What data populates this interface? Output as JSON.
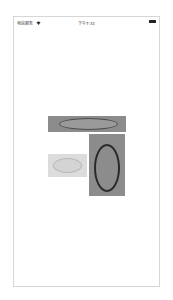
{
  "status_bar": {
    "carrier": "电信服务",
    "wifi_icon": "wifi-icon",
    "time": "下午7:31",
    "battery_icon": "battery-icon"
  },
  "shapes": [
    {
      "name": "wide-rect",
      "rect_color": "#8c8c8c",
      "ellipse_stroke": "#4d4d4d",
      "ellipse_fill": "#9a9a9a"
    },
    {
      "name": "faded-rect",
      "rect_color": "#dcdcdc",
      "ellipse_stroke": "#b8b8b8",
      "ellipse_fill": "#d4d4d4"
    },
    {
      "name": "tall-rect",
      "rect_color": "#8c8c8c",
      "ellipse_stroke": "#2a2a2a",
      "ellipse_fill": "#8c8c8c"
    }
  ]
}
